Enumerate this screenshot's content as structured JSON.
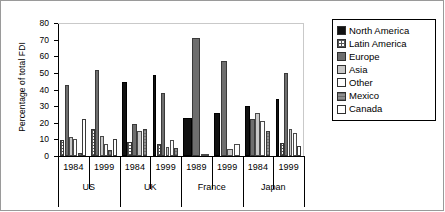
{
  "chart_data": {
    "type": "bar",
    "title": "",
    "xlabel": "",
    "ylabel": "Percentage of total FDI",
    "ylim": [
      0,
      80
    ],
    "yticks": [
      0,
      10,
      20,
      30,
      40,
      50,
      60,
      70,
      80
    ],
    "grid": false,
    "legend_position": "right",
    "categories": [
      "1984",
      "1999",
      "1984",
      "1999",
      "1989",
      "1999",
      "1984",
      "1999"
    ],
    "groups": [
      {
        "country": "US",
        "years": [
          "1984",
          "1999"
        ]
      },
      {
        "country": "UK",
        "years": [
          "1984",
          "1999"
        ]
      },
      {
        "country": "France",
        "years": [
          "1989",
          "1999"
        ]
      },
      {
        "country": "Japan",
        "years": [
          "1984",
          "1999"
        ]
      }
    ],
    "series": [
      {
        "name": "North America",
        "color": "#111111",
        "values": [
          0,
          0,
          44.5,
          49,
          23,
          26,
          30,
          34
        ]
      },
      {
        "name": "Latin America",
        "color": "#ffffff",
        "values": [
          9.5,
          16.5,
          8.5,
          7,
          0,
          0,
          0,
          8
        ]
      },
      {
        "name": "Europe",
        "color": "#6e6e6e",
        "values": [
          43,
          52,
          19,
          38,
          71,
          57,
          22,
          50
        ]
      },
      {
        "name": "Asia",
        "color": "#c8c8c8",
        "values": [
          11.5,
          12,
          15,
          5.5,
          0,
          4.5,
          26,
          16
        ]
      },
      {
        "name": "Other",
        "color": "#fdfdfd",
        "values": [
          10,
          7,
          0,
          9.5,
          1.5,
          7.5,
          21,
          14
        ]
      },
      {
        "name": "Mexico",
        "color": "#8e8e8e",
        "values": [
          2,
          3.5,
          16,
          5,
          0,
          0,
          15,
          0
        ]
      },
      {
        "name": "Canada",
        "color": "#ffffff",
        "values": [
          22,
          10,
          0,
          0,
          0,
          0,
          0,
          6
        ]
      }
    ]
  },
  "legend": {
    "items": [
      {
        "label": "North America",
        "swatch": "s-na"
      },
      {
        "label": "Latin America",
        "swatch": "s-la"
      },
      {
        "label": "Europe",
        "swatch": "s-eu"
      },
      {
        "label": "Asia",
        "swatch": "s-as"
      },
      {
        "label": "Other",
        "swatch": "s-ot"
      },
      {
        "label": "Mexico",
        "swatch": "s-mx"
      },
      {
        "label": "Canada",
        "swatch": "s-ca"
      }
    ]
  },
  "axis": {
    "y_title": "Percentage of total FDI",
    "y_tick_labels": [
      "80",
      "70",
      "60",
      "50",
      "40",
      "30",
      "20",
      "10",
      "0"
    ],
    "x_year_labels": [
      "1984",
      "1999",
      "1984",
      "1999",
      "1989",
      "1999",
      "1984",
      "1999"
    ],
    "x_country_labels": [
      "US",
      "UK",
      "France",
      "Japan"
    ]
  }
}
